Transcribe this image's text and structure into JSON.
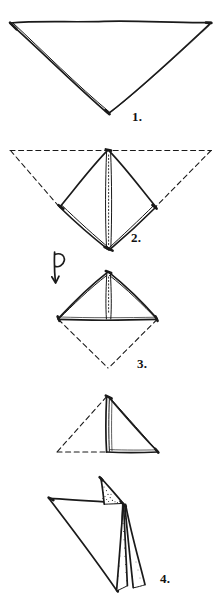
{
  "document": {
    "kind": "napkin-folding-instruction-diagram",
    "title": "Napkin Fold Steps",
    "background_color": "#ffffff",
    "ink_color": "#1a1a1a",
    "style": "hand-drawn line art, black ink on white"
  },
  "steps": [
    {
      "id": "step-1",
      "number": "1.",
      "caption_position": {
        "x": 132,
        "y": 110
      },
      "shape": "downward-pointing triangle folded from square napkin",
      "notes": "double line along left and lower-right edges indicates folded layers",
      "vertices": {
        "top_left": [
          10,
          23
        ],
        "top_right": [
          211,
          23
        ],
        "bottom_apex": [
          108,
          113
        ]
      }
    },
    {
      "id": "step-2",
      "number": "2.",
      "caption_position": {
        "x": 131,
        "y": 231
      },
      "shape": "diamond (square on point)",
      "notes": "dashed lines show original triangle corners folded up to bottom point; dotted vertical centre seam",
      "vertices": {
        "top": [
          108,
          150
        ],
        "left": [
          60,
          207
        ],
        "right": [
          156,
          207
        ],
        "bottom": [
          109,
          250
        ]
      },
      "dashed_outline": {
        "top_left": [
          10,
          150
        ],
        "top_right": [
          212,
          150
        ],
        "apex": [
          108,
          150
        ]
      }
    },
    {
      "id": "step-3",
      "number": "3.",
      "caption_position": {
        "x": 137,
        "y": 357
      },
      "shape": "upward-pointing triangle, bottom half folded behind",
      "notes": "turn-over arrow at the left; dashed lines show the half folded to the back",
      "vertices": {
        "apex": [
          108,
          272
        ],
        "left": [
          58,
          319
        ],
        "right": [
          157,
          319
        ]
      },
      "dashed_point": [
        108,
        368
      ],
      "arrow": {
        "name": "turn-over-arrow",
        "position": [
          58,
          252
        ],
        "meaning": "flip the napkin over"
      }
    },
    {
      "id": "step-4",
      "number": "",
      "caption_position": null,
      "shape": "right-pointing triangle, left half folded behind",
      "notes": "unnumbered intermediate step; dashed lines mark the hidden left half",
      "vertices": {
        "top": [
          107,
          396
        ],
        "bottom_left": [
          107,
          452
        ],
        "bottom_right": [
          158,
          452
        ]
      },
      "dashed_point": [
        57,
        452
      ]
    },
    {
      "id": "step-5",
      "number": "4.",
      "caption_position": {
        "x": 160,
        "y": 572
      },
      "shape": "finished fold with layers fanned open",
      "notes": "large left wing, upright pocket at top, two narrow stippled petals hanging lower right",
      "vertices": {
        "left_tip": [
          49,
          498
        ],
        "top_tip": [
          101,
          478
        ],
        "hub": [
          123,
          503
        ],
        "bottom_left_tip": [
          118,
          592
        ],
        "petal_outer_tip": [
          145,
          586
        ]
      }
    }
  ]
}
